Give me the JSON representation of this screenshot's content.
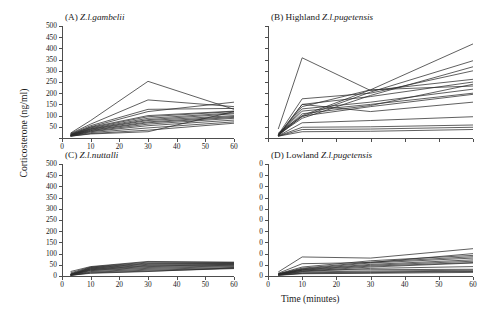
{
  "figure": {
    "ylabel": "Corticosterone (ng/ml)",
    "xlabel": "Time (minutes)"
  },
  "chart_data": [
    {
      "type": "line",
      "panel": "A",
      "title_prefix": "(A) ",
      "title_species": "Z.l.gambelii",
      "title": "(A) Z.l.gambelii",
      "xlabel": "Time (minutes)",
      "ylabel": "Corticosterone (ng/ml)",
      "xlim": [
        0,
        60
      ],
      "ylim": [
        0,
        500
      ],
      "xticks": [
        0,
        10,
        20,
        30,
        40,
        50,
        60
      ],
      "yticks": [
        0,
        50,
        100,
        150,
        200,
        250,
        300,
        350,
        400,
        450,
        500
      ],
      "ytick_labels": [
        "",
        "50",
        "100",
        "150",
        "200",
        "250",
        "300",
        "350",
        "400",
        "450",
        "500"
      ],
      "xtick_labels": [
        "0",
        "10",
        "20",
        "30",
        "40",
        "50",
        "60"
      ],
      "grid": false,
      "legend": "none",
      "x": [
        3,
        10,
        30,
        60
      ],
      "series": [
        {
          "name": "bird-a1",
          "values": [
            22,
            78,
            253,
            128
          ]
        },
        {
          "name": "bird-a2",
          "values": [
            20,
            62,
            170,
            140
          ]
        },
        {
          "name": "bird-a3",
          "values": [
            18,
            55,
            128,
            132
          ]
        },
        {
          "name": "bird-a4",
          "values": [
            16,
            50,
            118,
            160
          ]
        },
        {
          "name": "bird-a5",
          "values": [
            15,
            48,
            100,
            120
          ]
        },
        {
          "name": "bird-a6",
          "values": [
            14,
            45,
            95,
            118
          ]
        },
        {
          "name": "bird-a7",
          "values": [
            13,
            42,
            88,
            112
          ]
        },
        {
          "name": "bird-a8",
          "values": [
            12,
            40,
            82,
            108
          ]
        },
        {
          "name": "bird-a9",
          "values": [
            12,
            38,
            78,
            100
          ]
        },
        {
          "name": "bird-a10",
          "values": [
            11,
            35,
            72,
            96
          ]
        },
        {
          "name": "bird-a11",
          "values": [
            10,
            33,
            68,
            92
          ]
        },
        {
          "name": "bird-a12",
          "values": [
            10,
            30,
            62,
            88
          ]
        },
        {
          "name": "bird-a13",
          "values": [
            9,
            28,
            55,
            80
          ]
        },
        {
          "name": "bird-a14",
          "values": [
            9,
            24,
            45,
            72
          ]
        },
        {
          "name": "bird-a15",
          "values": [
            8,
            20,
            35,
            66
          ]
        },
        {
          "name": "bird-a16",
          "values": [
            8,
            18,
            28,
            118
          ]
        }
      ]
    },
    {
      "type": "line",
      "panel": "B",
      "title_prefix": "(B) Highland ",
      "title_species": "Z.l.pugetensis",
      "title": "(B) Highland Z.l.pugetensis",
      "xlabel": "Time (minutes)",
      "ylabel": "Corticosterone (ng/ml)",
      "xlim": [
        0,
        60
      ],
      "ylim": [
        0,
        500
      ],
      "xticks": [
        0,
        10,
        20,
        30,
        40,
        50,
        60
      ],
      "yticks": [
        0,
        50,
        100,
        150,
        200,
        250,
        300,
        350,
        400,
        450,
        500
      ],
      "ytick_labels": [
        "",
        "",
        "",
        "",
        "",
        "",
        "",
        "",
        "",
        "",
        ""
      ],
      "xtick_labels": [
        "",
        "",
        "",
        "",
        "",
        "",
        ""
      ],
      "grid": false,
      "legend": "none",
      "x": [
        3,
        10,
        30,
        60
      ],
      "series": [
        {
          "name": "bird-b1",
          "values": [
            40,
            358,
            212,
            262
          ]
        },
        {
          "name": "bird-b2",
          "values": [
            22,
            100,
            215,
            420
          ]
        },
        {
          "name": "bird-b3",
          "values": [
            18,
            95,
            205,
            345
          ]
        },
        {
          "name": "bird-b4",
          "values": [
            16,
            88,
            190,
            318
          ]
        },
        {
          "name": "bird-b5",
          "values": [
            15,
            175,
            200,
            300
          ]
        },
        {
          "name": "bird-b6",
          "values": [
            14,
            150,
            185,
            250
          ]
        },
        {
          "name": "bird-b7",
          "values": [
            13,
            140,
            215,
            232
          ]
        },
        {
          "name": "bird-b8",
          "values": [
            12,
            130,
            160,
            218
          ]
        },
        {
          "name": "bird-b9",
          "values": [
            12,
            120,
            150,
            200
          ]
        },
        {
          "name": "bird-b10",
          "values": [
            11,
            108,
            145,
            240
          ]
        },
        {
          "name": "bird-b11",
          "values": [
            10,
            98,
            140,
            195
          ]
        },
        {
          "name": "bird-b12",
          "values": [
            10,
            150,
            118,
            160
          ]
        },
        {
          "name": "bird-b13",
          "values": [
            9,
            68,
            78,
            95
          ]
        },
        {
          "name": "bird-b14",
          "values": [
            9,
            48,
            50,
            58
          ]
        },
        {
          "name": "bird-b15",
          "values": [
            8,
            38,
            40,
            48
          ]
        },
        {
          "name": "bird-b16",
          "values": [
            8,
            28,
            30,
            38
          ]
        }
      ]
    },
    {
      "type": "line",
      "panel": "C",
      "title_prefix": "(C) ",
      "title_species": "Z.l.nuttalli",
      "title": "(C) Z.l.nuttalli",
      "xlabel": "Time (minutes)",
      "ylabel": "Corticosterone (ng/ml)",
      "xlim": [
        0,
        60
      ],
      "ylim": [
        0,
        500
      ],
      "xticks": [
        0,
        10,
        20,
        30,
        40,
        50,
        60
      ],
      "yticks": [
        0,
        50,
        100,
        150,
        200,
        250,
        300,
        350,
        400,
        450,
        500
      ],
      "ytick_labels": [
        "0",
        "50",
        "100",
        "150",
        "200",
        "250",
        "300",
        "350",
        "400",
        "450",
        "500"
      ],
      "xtick_labels": [
        "0",
        "10",
        "20",
        "30",
        "40",
        "50",
        "60"
      ],
      "grid": false,
      "legend": "none",
      "x": [
        3,
        10,
        30,
        60
      ],
      "series": [
        {
          "name": "bird-c1",
          "values": [
            20,
            42,
            65,
            62
          ]
        },
        {
          "name": "bird-c2",
          "values": [
            14,
            40,
            62,
            60
          ]
        },
        {
          "name": "bird-c3",
          "values": [
            10,
            38,
            58,
            58
          ]
        },
        {
          "name": "bird-c4",
          "values": [
            8,
            36,
            55,
            56
          ]
        },
        {
          "name": "bird-c5",
          "values": [
            7,
            34,
            52,
            54
          ]
        },
        {
          "name": "bird-c6",
          "values": [
            6,
            32,
            48,
            52
          ]
        },
        {
          "name": "bird-c7",
          "values": [
            6,
            30,
            45,
            50
          ]
        },
        {
          "name": "bird-c8",
          "values": [
            5,
            28,
            42,
            48
          ]
        },
        {
          "name": "bird-c9",
          "values": [
            5,
            26,
            38,
            45
          ]
        },
        {
          "name": "bird-c10",
          "values": [
            4,
            24,
            34,
            42
          ]
        },
        {
          "name": "bird-c11",
          "values": [
            4,
            20,
            30,
            38
          ]
        },
        {
          "name": "bird-c12",
          "values": [
            3,
            17,
            26,
            35
          ]
        },
        {
          "name": "bird-c13",
          "values": [
            3,
            14,
            22,
            33
          ]
        },
        {
          "name": "bird-c14",
          "values": [
            3,
            12,
            20,
            36
          ]
        }
      ]
    },
    {
      "type": "line",
      "panel": "D",
      "title_prefix": "(D) Lowland ",
      "title_species": "Z.l.pugetensis",
      "title": "(D) Lowland Z.l.pugetensis",
      "xlabel": "Time (minutes)",
      "ylabel": "Corticosterone (ng/ml)",
      "xlim": [
        0,
        60
      ],
      "ylim": [
        0,
        500
      ],
      "xticks": [
        0,
        10,
        20,
        30,
        40,
        50,
        60
      ],
      "yticks": [
        0,
        50,
        100,
        150,
        200,
        250,
        300,
        350,
        400,
        450,
        500
      ],
      "ytick_labels": [
        "0",
        "0",
        "0",
        "0",
        "0",
        "0",
        "0",
        "0",
        "0",
        "0",
        "0"
      ],
      "xtick_labels": [
        "0",
        "10",
        "20",
        "30",
        "40",
        "50",
        "60"
      ],
      "grid": false,
      "legend": "none",
      "x": [
        3,
        10,
        30,
        60
      ],
      "series": [
        {
          "name": "bird-d1",
          "values": [
            18,
            85,
            80,
            122
          ]
        },
        {
          "name": "bird-d2",
          "values": [
            12,
            55,
            60,
            100
          ]
        },
        {
          "name": "bird-d3",
          "values": [
            10,
            40,
            68,
            92
          ]
        },
        {
          "name": "bird-d4",
          "values": [
            9,
            35,
            62,
            86
          ]
        },
        {
          "name": "bird-d5",
          "values": [
            8,
            32,
            58,
            80
          ]
        },
        {
          "name": "bird-d6",
          "values": [
            8,
            30,
            52,
            72
          ]
        },
        {
          "name": "bird-d7",
          "values": [
            7,
            28,
            48,
            66
          ]
        },
        {
          "name": "bird-d8",
          "values": [
            7,
            26,
            44,
            60
          ]
        },
        {
          "name": "bird-d9",
          "values": [
            6,
            22,
            40,
            58
          ]
        },
        {
          "name": "bird-d10",
          "values": [
            6,
            20,
            34,
            42
          ]
        },
        {
          "name": "bird-d11",
          "values": [
            5,
            26,
            28,
            30
          ]
        },
        {
          "name": "bird-d12",
          "values": [
            5,
            18,
            22,
            26
          ]
        },
        {
          "name": "bird-d13",
          "values": [
            4,
            14,
            18,
            22
          ]
        },
        {
          "name": "bird-d14",
          "values": [
            4,
            12,
            15,
            20
          ]
        },
        {
          "name": "bird-d15",
          "values": [
            3,
            10,
            12,
            16
          ]
        }
      ]
    }
  ]
}
